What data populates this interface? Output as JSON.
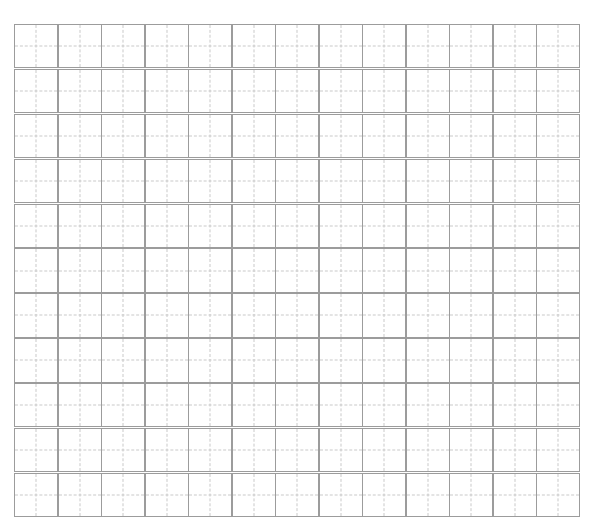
{
  "page": {
    "background_color": "#ffffff",
    "width": 594,
    "height": 528,
    "header_artifact_text": "",
    "grid_type": "tianzige"
  },
  "grid": {
    "rows": 11,
    "columns": 13,
    "cell_size_px": 44,
    "origin_x_px": 14,
    "origin_y_px": 24,
    "border_color": "#9c9c9c",
    "guide_line_color": "#c9c9c9",
    "guide_line_style": "dashed",
    "cell_fill_color": "#ffffff",
    "all_cells_empty": true,
    "cell_contents": [
      [
        "",
        "",
        "",
        "",
        "",
        "",
        "",
        "",
        "",
        "",
        "",
        "",
        ""
      ],
      [
        "",
        "",
        "",
        "",
        "",
        "",
        "",
        "",
        "",
        "",
        "",
        "",
        ""
      ],
      [
        "",
        "",
        "",
        "",
        "",
        "",
        "",
        "",
        "",
        "",
        "",
        "",
        ""
      ],
      [
        "",
        "",
        "",
        "",
        "",
        "",
        "",
        "",
        "",
        "",
        "",
        "",
        ""
      ],
      [
        "",
        "",
        "",
        "",
        "",
        "",
        "",
        "",
        "",
        "",
        "",
        "",
        ""
      ],
      [
        "",
        "",
        "",
        "",
        "",
        "",
        "",
        "",
        "",
        "",
        "",
        "",
        ""
      ],
      [
        "",
        "",
        "",
        "",
        "",
        "",
        "",
        "",
        "",
        "",
        "",
        "",
        ""
      ],
      [
        "",
        "",
        "",
        "",
        "",
        "",
        "",
        "",
        "",
        "",
        "",
        "",
        ""
      ],
      [
        "",
        "",
        "",
        "",
        "",
        "",
        "",
        "",
        "",
        "",
        "",
        "",
        ""
      ],
      [
        "",
        "",
        "",
        "",
        "",
        "",
        "",
        "",
        "",
        "",
        "",
        "",
        ""
      ],
      [
        "",
        "",
        "",
        "",
        "",
        "",
        "",
        "",
        "",
        "",
        "",
        "",
        ""
      ]
    ]
  }
}
